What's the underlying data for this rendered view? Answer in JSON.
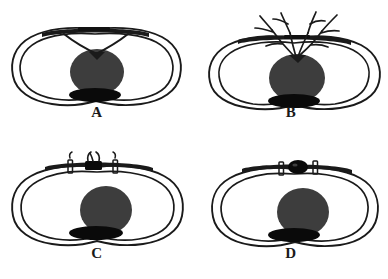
{
  "figure": {
    "type": "anatomical-cross-section-diagram",
    "panel_count": 4,
    "background_color": "#ffffff",
    "layout": "2x2 grid",
    "colors": {
      "outline": "#1a1a1a",
      "mass_gray": "#3d3d3d",
      "mass_black": "#0a0a0a",
      "label_text": "#1a1a1a"
    }
  },
  "panels": [
    {
      "id": "A",
      "label": "A",
      "features": {
        "outer_contour": "double-line rounded lobed outline",
        "central_mass": "dark gray filled circle",
        "lower_mass": "black flattened ellipse beneath circle",
        "top_bar": "thick horizontal band across upper region",
        "special": "two strands descend from the top bar and cross in a V shape meeting the apex of the central circle"
      }
    },
    {
      "id": "B",
      "label": "B",
      "features": {
        "outer_contour": "double-line rounded lobed outline",
        "central_mass": "dark gray filled circle",
        "lower_mass": "black flattened ellipse beneath circle",
        "top_bar": "thick horizontal band across upper region",
        "special": "branching tree-like filaments radiate upward from the apex of the central circle, passing through the top bar and spreading outward"
      }
    },
    {
      "id": "C",
      "label": "C",
      "features": {
        "outer_contour": "double-line rounded lobed outline",
        "central_mass": "dark gray filled circle",
        "lower_mass": "black flattened ellipse beneath circle",
        "top_bar": "thick horizontal band across upper region",
        "special": "small black clip with wing-like prongs centered on the top bar, flanked by two narrow vertical bracket clips"
      }
    },
    {
      "id": "D",
      "label": "D",
      "features": {
        "outer_contour": "double-line rounded lobed outline",
        "central_mass": "dark gray filled circle",
        "lower_mass": "black flattened ellipse beneath circle",
        "top_bar": "thick horizontal band across upper region",
        "special": "solid black rounded bead centered on the top bar, flanked by two narrow vertical bracket clips"
      }
    }
  ]
}
